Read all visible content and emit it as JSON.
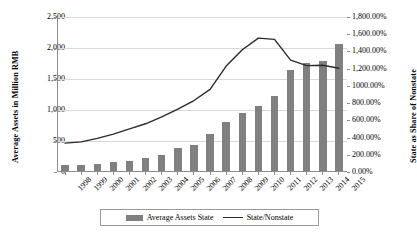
{
  "chart_data": {
    "type": "bar",
    "title": "",
    "xlabel": "",
    "ylabel": "Average Assets in Million RMB",
    "y2label": "State as Share of Nonstate",
    "grid": true,
    "legend_position": "bottom",
    "categories": [
      "1998",
      "1999",
      "2000",
      "2001",
      "2002",
      "2003",
      "2004",
      "2005",
      "2006",
      "2007",
      "2008",
      "2009",
      "2010",
      "2011",
      "2012",
      "2013",
      "2014",
      "2015"
    ],
    "ylim": [
      0,
      2500
    ],
    "y2lim": [
      0,
      1800
    ],
    "yticks": [
      "0",
      "500",
      "1,000",
      "1,500",
      "2,000",
      "2,500"
    ],
    "y2ticks": [
      "0.00%",
      "200.00%",
      "400.00%",
      "600.00%",
      "800.00%",
      "1000.00%",
      "1,200.00%",
      "1,400.00%",
      "1,600.00%",
      "1,800.00%"
    ],
    "series": [
      {
        "name": "Average Assets State",
        "type": "bar",
        "axis": "left",
        "color": "#808080",
        "values": [
          110,
          120,
          135,
          160,
          185,
          230,
          275,
          390,
          440,
          610,
          810,
          950,
          1060,
          1225,
          1650,
          1760,
          1790,
          2060
        ]
      },
      {
        "name": "State/Nonstate",
        "type": "line",
        "axis": "right",
        "color": "#2b2b2b",
        "values": [
          335,
          350,
          390,
          440,
          500,
          560,
          640,
          730,
          830,
          960,
          1230,
          1420,
          1555,
          1540,
          1300,
          1235,
          1240,
          1205
        ]
      }
    ]
  },
  "legend": {
    "items": [
      {
        "label": "Average Assets State",
        "marker": "bar-swatch"
      },
      {
        "label": "State/Nonstate",
        "marker": "line-swatch"
      }
    ]
  }
}
